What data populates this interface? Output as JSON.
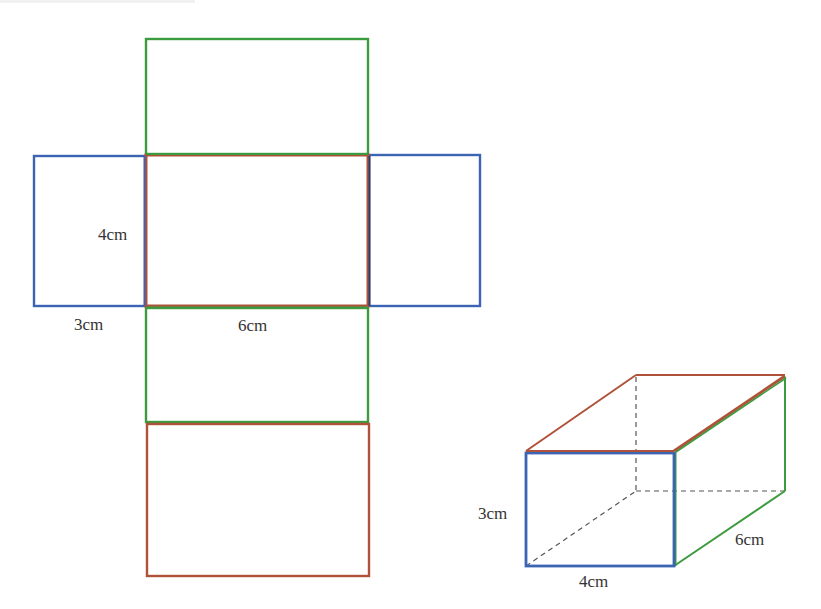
{
  "figure": {
    "colors": {
      "blue": "#3b65b3",
      "green": "#3c9b3e",
      "red": "#b0523a",
      "dashed": "#555555",
      "text": "#333333"
    },
    "net": {
      "faces": [
        {
          "name": "top-face",
          "color": "green",
          "x": 146,
          "y": 39,
          "w": 222,
          "h": 115
        },
        {
          "name": "left-face",
          "color": "blue",
          "x": 34,
          "y": 156,
          "w": 111,
          "h": 150
        },
        {
          "name": "center-face",
          "color": "red",
          "x": 146,
          "y": 155,
          "w": 222,
          "h": 151
        },
        {
          "name": "right-face",
          "color": "blue",
          "x": 369,
          "y": 155,
          "w": 111,
          "h": 151
        },
        {
          "name": "front-face",
          "color": "green",
          "x": 146,
          "y": 308,
          "w": 222,
          "h": 114
        },
        {
          "name": "bottom-face",
          "color": "red",
          "x": 147,
          "y": 424,
          "w": 222,
          "h": 152
        }
      ],
      "labels": {
        "height": "4cm",
        "width_side": "3cm",
        "length": "6cm"
      }
    },
    "cuboid": {
      "front_face_color": "blue",
      "side_face_color": "green",
      "top_face_color": "red",
      "labels": {
        "height": "3cm",
        "width": "4cm",
        "depth": "6cm"
      }
    }
  }
}
